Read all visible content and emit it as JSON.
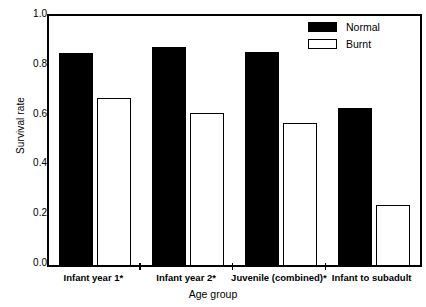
{
  "chart_data": {
    "type": "bar",
    "title": "",
    "xlabel": "Age group",
    "ylabel": "Survival rate",
    "categories": [
      "Infant year 1*",
      "Infant year 2*",
      "Juvenile  (combined)*",
      "Infant to subadult"
    ],
    "series": [
      {
        "name": "Normal",
        "color": "#000000",
        "fill": "solid",
        "values": [
          0.85,
          0.875,
          0.855,
          0.63
        ]
      },
      {
        "name": "Burnt",
        "color": "#ffffff",
        "fill": "outline",
        "values": [
          0.67,
          0.61,
          0.57,
          0.24
        ]
      }
    ],
    "ylim": [
      0.0,
      1.0
    ],
    "yticks": [
      "0.0",
      "0.2",
      "0.4",
      "0.6",
      "0.8",
      "1.0"
    ],
    "ytick_values": [
      0.0,
      0.2,
      0.4,
      0.6,
      0.8,
      1.0
    ],
    "grid": false,
    "legend_position": "top-right",
    "legend_entries": [
      "Normal",
      "Burnt"
    ],
    "axis_color": "#000000",
    "background": "#ffffff"
  }
}
